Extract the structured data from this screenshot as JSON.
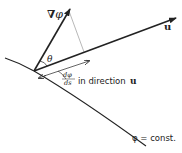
{
  "diagram": {
    "labels": {
      "gradient": "∇φ",
      "gradient_nabla": "∇",
      "gradient_phi": "φ",
      "unit_vector": "u",
      "angle": "θ",
      "derivative_num": "dφ",
      "derivative_den": "ds",
      "derivative_suffix": "in direction",
      "derivative_vector": "u",
      "level_curve": "φ = const."
    },
    "colors": {
      "stroke": "#222222",
      "dashed": "#888888",
      "background": "#ffffff"
    }
  }
}
